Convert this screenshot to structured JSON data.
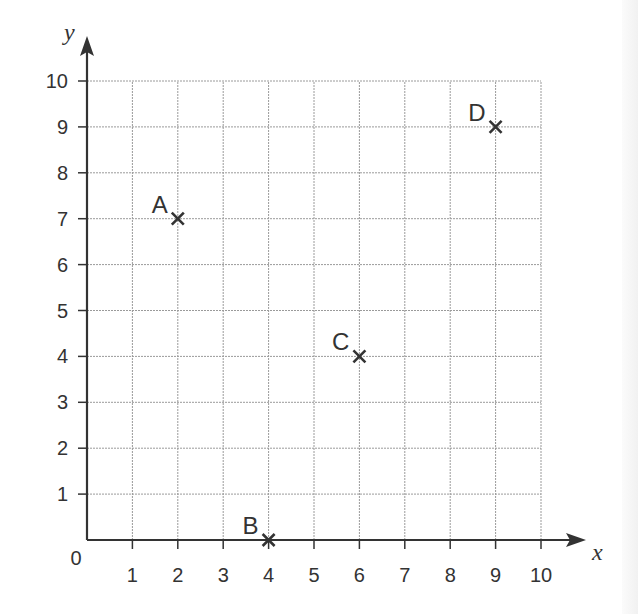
{
  "chart_data": {
    "type": "scatter",
    "title": "",
    "xlabel": "x",
    "ylabel": "y",
    "xlim": [
      0,
      10
    ],
    "ylim": [
      0,
      10
    ],
    "grid": true,
    "origin_label": "0",
    "x_ticks": [
      "1",
      "2",
      "3",
      "4",
      "5",
      "6",
      "7",
      "8",
      "9",
      "10"
    ],
    "y_ticks": [
      "1",
      "2",
      "3",
      "4",
      "5",
      "6",
      "7",
      "8",
      "9",
      "10"
    ],
    "points": [
      {
        "label": "A",
        "x": 2,
        "y": 7
      },
      {
        "label": "B",
        "x": 4,
        "y": 0
      },
      {
        "label": "C",
        "x": 6,
        "y": 4
      },
      {
        "label": "D",
        "x": 9,
        "y": 9
      }
    ],
    "marker": "x",
    "colors": {
      "axis": "#333333",
      "grid": "#9a9a9a",
      "text": "#333333"
    }
  }
}
